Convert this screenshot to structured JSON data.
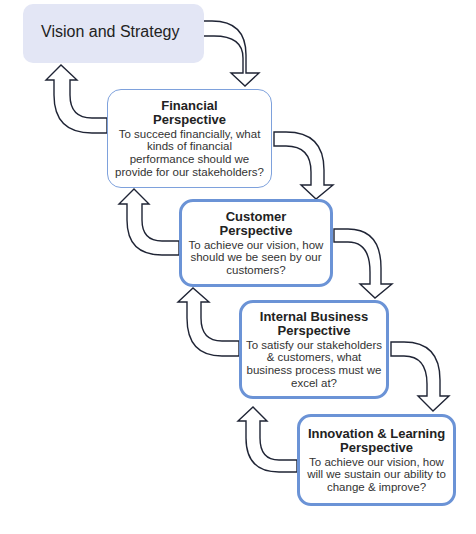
{
  "diagram": {
    "type": "balanced-scorecard-cascade",
    "accent_border_color": "#6b93d6",
    "vision_fill_color": "#e3e6f5",
    "arrow_stroke_color": "#1f2435"
  },
  "vision": {
    "title": "Vision and Strategy"
  },
  "perspectives": [
    {
      "title_line1": "Financial",
      "title_line2": "Perspective",
      "description": "To succeed financially, what kinds of financial performance should we provide for our stakeholders?"
    },
    {
      "title_line1": "Customer",
      "title_line2": "Perspective",
      "description": "To achieve our vision, how should we be seen by our customers?"
    },
    {
      "title_line1": "Internal Business",
      "title_line2": "Perspective",
      "description": "To satisfy our stakeholders & customers, what business process must we excel at?"
    },
    {
      "title_line1": "Innovation & Learning",
      "title_line2": "Perspective",
      "description": "To achieve our vision, how will we sustain our ability to change & improve?"
    }
  ],
  "connectors": [
    {
      "from": "Vision and Strategy",
      "to": "Financial Perspective",
      "direction": "down"
    },
    {
      "from": "Financial Perspective",
      "to": "Customer Perspective",
      "direction": "down"
    },
    {
      "from": "Customer Perspective",
      "to": "Internal Business Perspective",
      "direction": "down"
    },
    {
      "from": "Internal Business Perspective",
      "to": "Innovation & Learning Perspective",
      "direction": "down"
    },
    {
      "from": "Financial Perspective",
      "to": "Vision and Strategy",
      "direction": "up"
    },
    {
      "from": "Customer Perspective",
      "to": "Financial Perspective",
      "direction": "up"
    },
    {
      "from": "Internal Business Perspective",
      "to": "Customer Perspective",
      "direction": "up"
    },
    {
      "from": "Innovation & Learning Perspective",
      "to": "Internal Business Perspective",
      "direction": "up"
    }
  ]
}
